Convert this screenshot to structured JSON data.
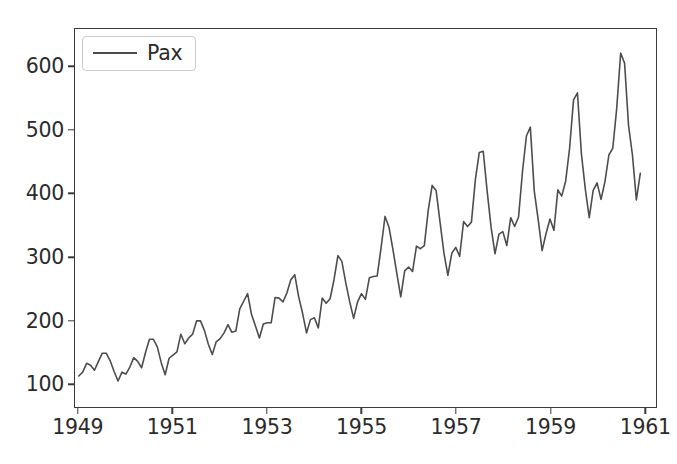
{
  "chart_data": {
    "type": "line",
    "title": "",
    "xlabel": "",
    "ylabel": "",
    "xlim": [
      1948.92,
      1961.25
    ],
    "ylim": [
      63,
      660
    ],
    "grid": false,
    "legend_position": "upper left",
    "xticks": [
      "1949",
      "1951",
      "1953",
      "1955",
      "1957",
      "1959",
      "1961"
    ],
    "xtick_values": [
      1949,
      1951,
      1953,
      1955,
      1957,
      1959,
      1961
    ],
    "yticks": [
      "100",
      "200",
      "300",
      "400",
      "500",
      "600"
    ],
    "ytick_values": [
      100,
      200,
      300,
      400,
      500,
      600
    ],
    "series": [
      {
        "name": "Pax",
        "color": "#4d4d4d",
        "linewidth": 1.6,
        "x": [
          1949.0,
          1949.0833,
          1949.1667,
          1949.25,
          1949.3333,
          1949.4167,
          1949.5,
          1949.5833,
          1949.6667,
          1949.75,
          1949.8333,
          1949.9167,
          1950.0,
          1950.0833,
          1950.1667,
          1950.25,
          1950.3333,
          1950.4167,
          1950.5,
          1950.5833,
          1950.6667,
          1950.75,
          1950.8333,
          1950.9167,
          1951.0,
          1951.0833,
          1951.1667,
          1951.25,
          1951.3333,
          1951.4167,
          1951.5,
          1951.5833,
          1951.6667,
          1951.75,
          1951.8333,
          1951.9167,
          1952.0,
          1952.0833,
          1952.1667,
          1952.25,
          1952.3333,
          1952.4167,
          1952.5,
          1952.5833,
          1952.6667,
          1952.75,
          1952.8333,
          1952.9167,
          1953.0,
          1953.0833,
          1953.1667,
          1953.25,
          1953.3333,
          1953.4167,
          1953.5,
          1953.5833,
          1953.6667,
          1953.75,
          1953.8333,
          1953.9167,
          1954.0,
          1954.0833,
          1954.1667,
          1954.25,
          1954.3333,
          1954.4167,
          1954.5,
          1954.5833,
          1954.6667,
          1954.75,
          1954.8333,
          1954.9167,
          1955.0,
          1955.0833,
          1955.1667,
          1955.25,
          1955.3333,
          1955.4167,
          1955.5,
          1955.5833,
          1955.6667,
          1955.75,
          1955.8333,
          1955.9167,
          1956.0,
          1956.0833,
          1956.1667,
          1956.25,
          1956.3333,
          1956.4167,
          1956.5,
          1956.5833,
          1956.6667,
          1956.75,
          1956.8333,
          1956.9167,
          1957.0,
          1957.0833,
          1957.1667,
          1957.25,
          1957.3333,
          1957.4167,
          1957.5,
          1957.5833,
          1957.6667,
          1957.75,
          1957.8333,
          1957.9167,
          1958.0,
          1958.0833,
          1958.1667,
          1958.25,
          1958.3333,
          1958.4167,
          1958.5,
          1958.5833,
          1958.6667,
          1958.75,
          1958.8333,
          1958.9167,
          1959.0,
          1959.0833,
          1959.1667,
          1959.25,
          1959.3333,
          1959.4167,
          1959.5,
          1959.5833,
          1959.6667,
          1959.75,
          1959.8333,
          1959.9167,
          1960.0,
          1960.0833,
          1960.1667,
          1960.25,
          1960.3333,
          1960.4167,
          1960.5,
          1960.5833,
          1960.6667,
          1960.75,
          1960.8333,
          1960.9167
        ],
        "values": [
          112,
          118,
          132,
          129,
          121,
          135,
          148,
          148,
          136,
          119,
          104,
          118,
          115,
          126,
          141,
          135,
          125,
          149,
          170,
          170,
          158,
          133,
          114,
          140,
          145,
          150,
          178,
          163,
          172,
          178,
          199,
          199,
          184,
          162,
          146,
          166,
          171,
          180,
          193,
          181,
          183,
          218,
          230,
          242,
          209,
          191,
          172,
          194,
          196,
          196,
          236,
          235,
          229,
          243,
          264,
          272,
          237,
          211,
          180,
          201,
          204,
          188,
          235,
          227,
          234,
          264,
          302,
          293,
          259,
          229,
          203,
          229,
          242,
          233,
          267,
          269,
          270,
          315,
          364,
          347,
          312,
          274,
          237,
          278,
          284,
          277,
          317,
          313,
          318,
          374,
          413,
          405,
          355,
          306,
          271,
          306,
          315,
          301,
          356,
          348,
          355,
          422,
          465,
          467,
          404,
          347,
          305,
          336,
          340,
          318,
          362,
          348,
          363,
          435,
          491,
          505,
          404,
          359,
          310,
          337,
          360,
          342,
          406,
          396,
          420,
          472,
          548,
          559,
          463,
          407,
          362,
          405,
          417,
          391,
          419,
          461,
          472,
          535,
          622,
          606,
          508,
          461,
          390,
          432
        ]
      }
    ]
  },
  "legend": {
    "label": "Pax"
  }
}
